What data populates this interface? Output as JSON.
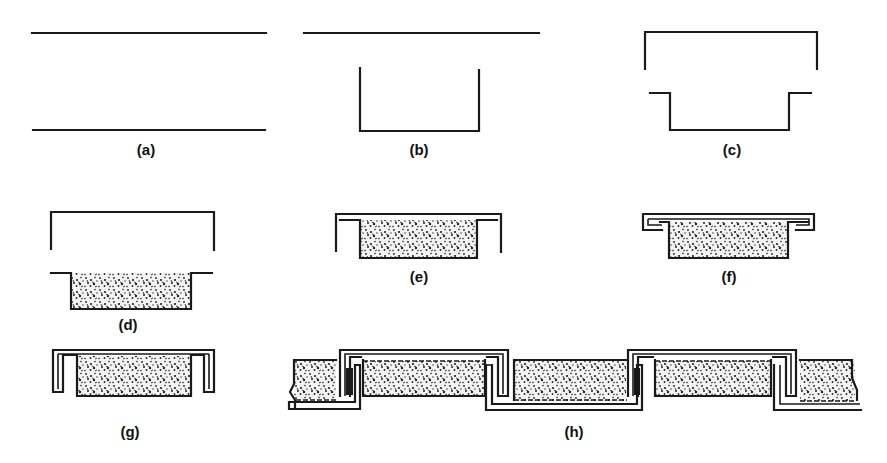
{
  "figure": {
    "panels": [
      {
        "id": "a",
        "label": "(a)",
        "content": "two parallel horizontal lines"
      },
      {
        "id": "b",
        "label": "(b)",
        "content": "horizontal line above a U-shaped channel"
      },
      {
        "id": "c",
        "label": "(c)",
        "content": "inverted U cap above flanged U channel"
      },
      {
        "id": "d",
        "label": "(d)",
        "content": "inverted U cap above flanged channel filled with granular material"
      },
      {
        "id": "e",
        "label": "(e)",
        "content": "cap lowered over filled flanged channel"
      },
      {
        "id": "f",
        "label": "(f)",
        "content": "cap edges folded under flanges"
      },
      {
        "id": "g",
        "label": "(g)",
        "content": "folded edges bent down into hooked legs"
      },
      {
        "id": "h",
        "label": "(h)",
        "content": "series of panels interlocked side by side"
      }
    ]
  },
  "colors": {
    "ink": "#1a1a1a",
    "background": "#ffffff",
    "stipple": "#2a2a2a"
  }
}
